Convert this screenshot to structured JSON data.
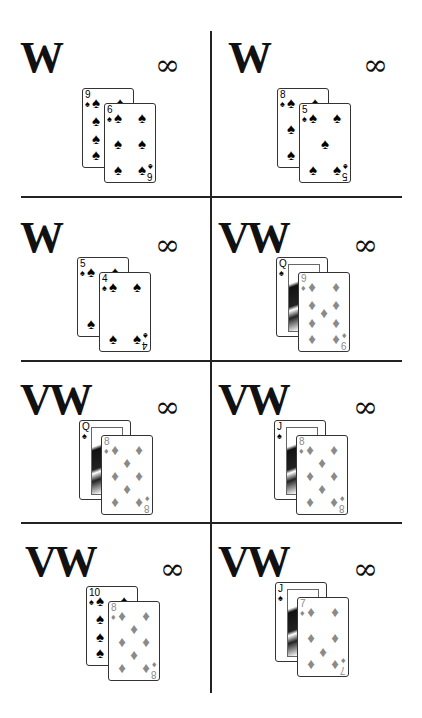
{
  "grid": {
    "rows": 4,
    "cols": 2,
    "cells": [
      {
        "label": "W",
        "symbol": "∞",
        "back": {
          "rank": "9",
          "suit": "spade"
        },
        "front": {
          "rank": "6",
          "suit": "spade"
        }
      },
      {
        "label": "W",
        "symbol": "∞",
        "back": {
          "rank": "8",
          "suit": "spade"
        },
        "front": {
          "rank": "5",
          "suit": "spade"
        }
      },
      {
        "label": "W",
        "symbol": "∞",
        "back": {
          "rank": "5",
          "suit": "spade"
        },
        "front": {
          "rank": "4",
          "suit": "spade"
        }
      },
      {
        "label": "VW",
        "symbol": "∞",
        "back": {
          "rank": "Q",
          "suit": "spade"
        },
        "front": {
          "rank": "9",
          "suit": "diamond"
        }
      },
      {
        "label": "VW",
        "symbol": "∞",
        "back": {
          "rank": "Q",
          "suit": "spade"
        },
        "front": {
          "rank": "8",
          "suit": "diamond"
        }
      },
      {
        "label": "VW",
        "symbol": "∞",
        "back": {
          "rank": "J",
          "suit": "spade"
        },
        "front": {
          "rank": "8",
          "suit": "diamond"
        }
      },
      {
        "label": "VW",
        "symbol": "∞",
        "back": {
          "rank": "10",
          "suit": "spade"
        },
        "front": {
          "rank": "8",
          "suit": "diamond"
        }
      },
      {
        "label": "VW",
        "symbol": "∞",
        "back": {
          "rank": "J",
          "suit": "spade"
        },
        "front": {
          "rank": "7",
          "suit": "diamond"
        }
      }
    ]
  },
  "suits": {
    "spade": "♠",
    "diamond": "♦"
  },
  "colors": {
    "spade": "#000000",
    "diamond": "#8a8a8a",
    "lines": "#222222"
  }
}
